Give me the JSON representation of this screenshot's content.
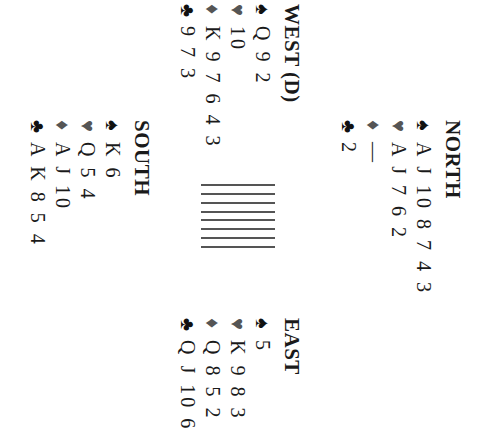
{
  "deal": {
    "north": {
      "title": "NORTH",
      "spades": "A J 10 8 7 4 3",
      "hearts": "A J 7 6 2",
      "diamonds": "—",
      "clubs": "2"
    },
    "west": {
      "title": "WEST (D)",
      "spades": "Q 9 2",
      "hearts": "10",
      "diamonds": "K 9 7 6 4 3",
      "clubs": "9 7 3"
    },
    "east": {
      "title": "EAST",
      "spades": "5",
      "hearts": "K 9 8 3",
      "diamonds": "Q 8 5 2",
      "clubs": "Q J 10 6"
    },
    "south": {
      "title": "SOUTH",
      "spades": "K 6",
      "hearts": "Q 5 4",
      "diamonds": "A J 10",
      "clubs": "A K 8 5 4"
    }
  },
  "symbols": {
    "spade": "♠",
    "heart": "♥",
    "diamond": "♦",
    "club": "♣"
  },
  "table_graphic": {
    "line_count": 8
  },
  "rotation_degrees": 90
}
